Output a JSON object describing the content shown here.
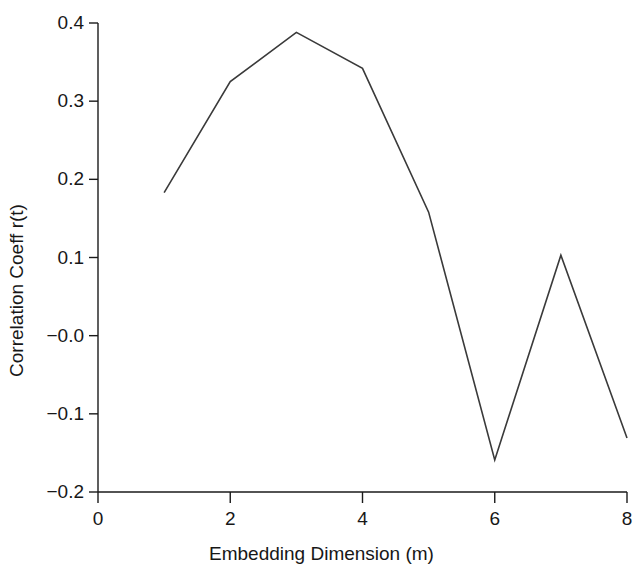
{
  "chart_data": {
    "type": "line",
    "title": "",
    "xlabel": "Embedding Dimension (m)",
    "ylabel": "Correlation Coeff r(t)",
    "x": [
      1,
      2,
      3,
      4,
      5,
      6,
      7,
      8
    ],
    "values": [
      0.183,
      0.325,
      0.388,
      0.342,
      0.158,
      -0.159,
      0.103,
      -0.131
    ],
    "series": [
      {
        "name": "Correlation Coeff r(t)",
        "values": [
          0.183,
          0.325,
          0.388,
          0.342,
          0.158,
          -0.159,
          0.103,
          -0.131
        ]
      }
    ],
    "xlim": [
      0,
      8
    ],
    "ylim": [
      -0.2,
      0.4
    ],
    "xticks": [
      0,
      2,
      4,
      6,
      8
    ],
    "xtick_labels": [
      "0",
      "2",
      "4",
      "6",
      "8"
    ],
    "yticks": [
      0.4,
      0.3,
      0.2,
      0.1,
      -0.0,
      -0.1,
      -0.2
    ],
    "ytick_labels": [
      "0.4",
      "0.3",
      "0.2",
      "0.1",
      "−0.0",
      "−0.1",
      "−0.2"
    ],
    "grid": false,
    "legend": null,
    "line_color": "#3a3a3a",
    "axis_color": "#1a1a1a",
    "background": "#ffffff"
  }
}
